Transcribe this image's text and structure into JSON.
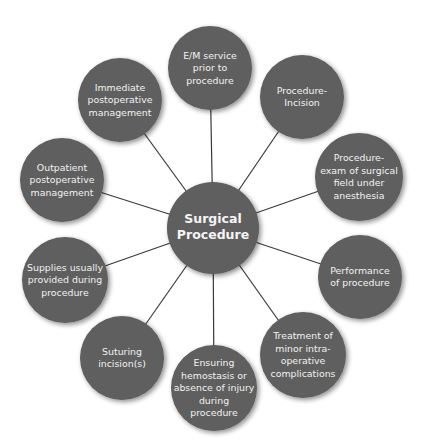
{
  "diagram": {
    "type": "hub-and-spoke",
    "colors": {
      "node_fill": "#5e5e5e",
      "text": "#f2f2f2",
      "connector": "#3a3a3a",
      "background": "#ffffff"
    },
    "center": {
      "label_lines": [
        "Surgical",
        "Procedure"
      ]
    },
    "nodes": [
      {
        "id": "em-service",
        "label_lines": [
          "E/M service",
          "prior to",
          "procedure"
        ]
      },
      {
        "id": "procedure-incision",
        "label_lines": [
          "Procedure-",
          "Incision"
        ]
      },
      {
        "id": "procedure-exam",
        "label_lines": [
          "Procedure-",
          "exam of surgical",
          "field under",
          "anesthesia"
        ]
      },
      {
        "id": "performance",
        "label_lines": [
          "Performance",
          "of procedure"
        ]
      },
      {
        "id": "treatment",
        "label_lines": [
          "Treatment of",
          "minor intra-",
          "operative",
          "complications"
        ]
      },
      {
        "id": "ensuring-hemostasis",
        "label_lines": [
          "Ensuring",
          "hemostasis or",
          "absence of injury",
          "during",
          "procedure"
        ]
      },
      {
        "id": "suturing",
        "label_lines": [
          "Suturing",
          "incision(s)"
        ]
      },
      {
        "id": "supplies",
        "label_lines": [
          "Supplies usually",
          "provided during",
          "procedure"
        ]
      },
      {
        "id": "outpatient-postop",
        "label_lines": [
          "Outpatient",
          "postoperative",
          "management"
        ]
      },
      {
        "id": "immediate-postop",
        "label_lines": [
          "Immediate",
          "postoperative",
          "management"
        ]
      }
    ]
  }
}
